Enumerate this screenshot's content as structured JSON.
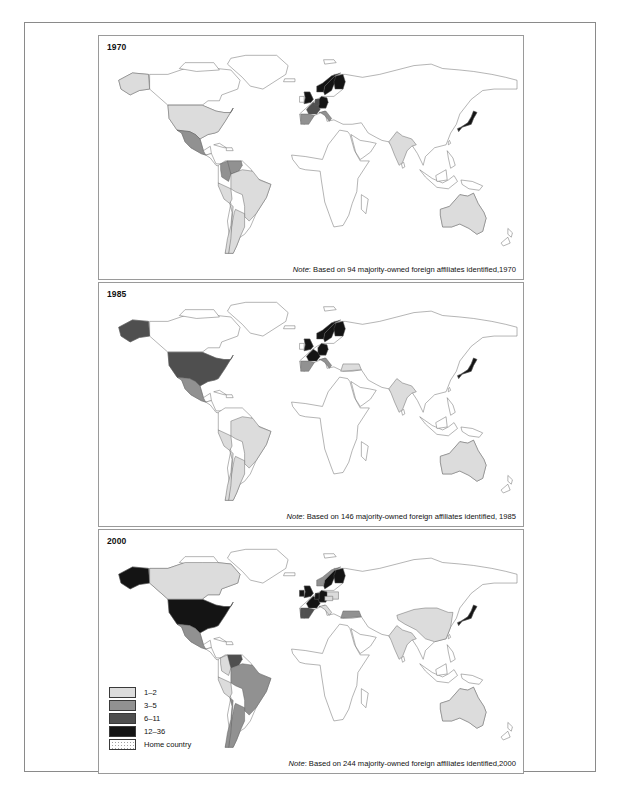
{
  "figure": {
    "panels": [
      {
        "year": "1970",
        "note_prefix": "Note",
        "note_text": ": Based on 94 majority-owned foreign affiliates identified,1970",
        "affiliate_count": "94"
      },
      {
        "year": "1985",
        "note_prefix": "Note",
        "note_text": ": Based on 146 majority-owned foreign affiliates identified, 1985",
        "affiliate_count": "146"
      },
      {
        "year": "2000",
        "note_prefix": "Note",
        "note_text": ": Based on 244 majority-owned foreign affiliates identified,2000",
        "affiliate_count": "244"
      }
    ]
  },
  "legend": {
    "items": [
      {
        "label": "1–2",
        "color": "#dcdcdc",
        "pattern": "solid"
      },
      {
        "label": "3–5",
        "color": "#919191",
        "pattern": "solid"
      },
      {
        "label": "6–11",
        "color": "#4f4f4f",
        "pattern": "solid"
      },
      {
        "label": "12–36",
        "color": "#141414",
        "pattern": "solid"
      },
      {
        "label": "Home country",
        "color": "#ffffff",
        "pattern": "stipple"
      }
    ]
  },
  "palette": {
    "base": "#ffffff",
    "class1": "#dcdcdc",
    "class2": "#919191",
    "class3": "#4f4f4f",
    "class4": "#141414",
    "outline": "#5a5a5a",
    "frame": "#8a8a8a",
    "panel_border": "#9a9a9a"
  },
  "chart_data": {
    "type": "map",
    "classes": [
      "1–2",
      "3–5",
      "6–11",
      "12–36",
      "Home country"
    ],
    "legend_position": "bottom-left of 2000 panel",
    "panels": [
      {
        "year": "1970",
        "total_affiliates": 94,
        "countries": [
          {
            "name": "United States",
            "class": "1-2"
          },
          {
            "name": "Alaska",
            "class": "1-2"
          },
          {
            "name": "Mexico",
            "class": "3-5"
          },
          {
            "name": "Venezuela",
            "class": "3-5"
          },
          {
            "name": "Colombia",
            "class": "3-5"
          },
          {
            "name": "Brazil",
            "class": "1-2"
          },
          {
            "name": "Argentina",
            "class": "1-2"
          },
          {
            "name": "Chile",
            "class": "1-2"
          },
          {
            "name": "Peru",
            "class": "1-2"
          },
          {
            "name": "Sweden",
            "class": "12-36"
          },
          {
            "name": "Norway",
            "class": "12-36"
          },
          {
            "name": "Finland",
            "class": "12-36"
          },
          {
            "name": "United Kingdom",
            "class": "12-36"
          },
          {
            "name": "Germany",
            "class": "12-36"
          },
          {
            "name": "France",
            "class": "6-11"
          },
          {
            "name": "Belgium",
            "class": "6-11"
          },
          {
            "name": "Netherlands",
            "class": "6-11"
          },
          {
            "name": "Spain",
            "class": "3-5"
          },
          {
            "name": "Italy",
            "class": "3-5"
          },
          {
            "name": "Japan",
            "class": "12-36"
          },
          {
            "name": "India",
            "class": "1-2"
          },
          {
            "name": "Australia",
            "class": "1-2"
          }
        ]
      },
      {
        "year": "1985",
        "total_affiliates": 146,
        "countries": [
          {
            "name": "United States",
            "class": "6-11"
          },
          {
            "name": "Alaska",
            "class": "6-11"
          },
          {
            "name": "Mexico",
            "class": "3-5"
          },
          {
            "name": "Brazil",
            "class": "1-2"
          },
          {
            "name": "Argentina",
            "class": "1-2"
          },
          {
            "name": "Chile",
            "class": "1-2"
          },
          {
            "name": "Peru",
            "class": "1-2"
          },
          {
            "name": "Sweden",
            "class": "12-36"
          },
          {
            "name": "Norway",
            "class": "12-36"
          },
          {
            "name": "Finland",
            "class": "12-36"
          },
          {
            "name": "United Kingdom",
            "class": "12-36"
          },
          {
            "name": "Germany",
            "class": "12-36"
          },
          {
            "name": "France",
            "class": "12-36"
          },
          {
            "name": "Spain",
            "class": "3-5"
          },
          {
            "name": "Italy",
            "class": "3-5"
          },
          {
            "name": "Turkey",
            "class": "1-2"
          },
          {
            "name": "Japan",
            "class": "12-36"
          },
          {
            "name": "India",
            "class": "1-2"
          },
          {
            "name": "Australia",
            "class": "1-2"
          }
        ]
      },
      {
        "year": "2000",
        "total_affiliates": 244,
        "countries": [
          {
            "name": "United States",
            "class": "12-36"
          },
          {
            "name": "Alaska",
            "class": "12-36"
          },
          {
            "name": "Canada",
            "class": "1-2"
          },
          {
            "name": "Mexico",
            "class": "3-5"
          },
          {
            "name": "Venezuela",
            "class": "6-11"
          },
          {
            "name": "Colombia",
            "class": "1-2"
          },
          {
            "name": "Brazil",
            "class": "3-5"
          },
          {
            "name": "Argentina",
            "class": "3-5"
          },
          {
            "name": "Chile",
            "class": "3-5"
          },
          {
            "name": "Peru",
            "class": "1-2"
          },
          {
            "name": "Sweden",
            "class": "12-36"
          },
          {
            "name": "Finland",
            "class": "12-36"
          },
          {
            "name": "Norway",
            "class": "3-5"
          },
          {
            "name": "United Kingdom",
            "class": "12-36"
          },
          {
            "name": "Ireland",
            "class": "12-36"
          },
          {
            "name": "Germany",
            "class": "12-36"
          },
          {
            "name": "France",
            "class": "12-36"
          },
          {
            "name": "Belgium",
            "class": "12-36"
          },
          {
            "name": "Netherlands",
            "class": "12-36"
          },
          {
            "name": "Spain",
            "class": "6-11"
          },
          {
            "name": "Portugal",
            "class": "6-11"
          },
          {
            "name": "Italy",
            "class": "1-2"
          },
          {
            "name": "Poland",
            "class": "1-2"
          },
          {
            "name": "Czech Republic",
            "class": "1-2"
          },
          {
            "name": "Turkey",
            "class": "3-5"
          },
          {
            "name": "China",
            "class": "1-2"
          },
          {
            "name": "India",
            "class": "1-2"
          },
          {
            "name": "Japan",
            "class": "12-36"
          },
          {
            "name": "Australia",
            "class": "1-2"
          }
        ]
      }
    ]
  }
}
